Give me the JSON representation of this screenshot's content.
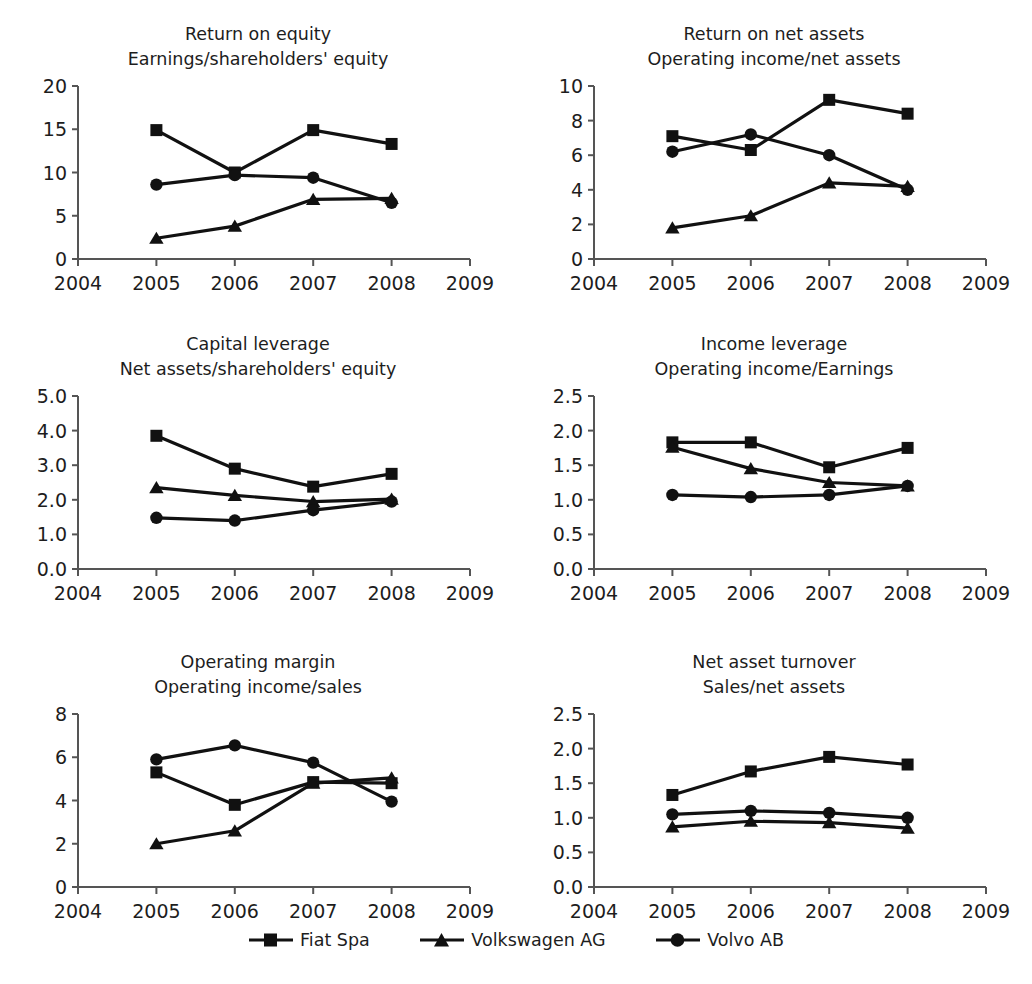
{
  "figure": {
    "series_names": [
      "Fiat Spa",
      "Volkswagen AG",
      "Volvo AB"
    ],
    "x_categories": [
      "2005",
      "2006",
      "2007",
      "2008"
    ],
    "x_axis_ticks": [
      "2004",
      "2005",
      "2006",
      "2007",
      "2008",
      "2009"
    ],
    "marker_color": "#111111",
    "line_color": "#111111",
    "axis_color": "#555555"
  },
  "legend": {
    "items": [
      {
        "label": "Fiat Spa",
        "marker": "square-marker"
      },
      {
        "label": "Volkswagen AG",
        "marker": "triangle-marker"
      },
      {
        "label": "Volvo AB",
        "marker": "circle-marker"
      }
    ]
  },
  "chart_data": [
    {
      "id": "return-on-equity",
      "type": "line",
      "title": "Return on equity",
      "subtitle": "Earnings/shareholders' equity",
      "xlabel": "",
      "ylabel": "",
      "x": [
        "2005",
        "2006",
        "2007",
        "2008"
      ],
      "xticks": [
        "2004",
        "2005",
        "2006",
        "2007",
        "2008",
        "2009"
      ],
      "yticks": [
        "0",
        "5",
        "10",
        "15",
        "20"
      ],
      "ylim": [
        0,
        20
      ],
      "grid": false,
      "legend_position": "bottom",
      "series": [
        {
          "name": "Fiat Spa",
          "marker": "square",
          "values": [
            14.9,
            10.0,
            14.9,
            13.3
          ]
        },
        {
          "name": "Volkswagen AG",
          "marker": "triangle",
          "values": [
            2.4,
            3.8,
            6.9,
            7.0
          ]
        },
        {
          "name": "Volvo AB",
          "marker": "circle",
          "values": [
            8.6,
            9.7,
            9.4,
            6.5
          ]
        }
      ]
    },
    {
      "id": "return-on-net-assets",
      "type": "line",
      "title": "Return on net assets",
      "subtitle": "Operating income/net assets",
      "xlabel": "",
      "ylabel": "",
      "x": [
        "2005",
        "2006",
        "2007",
        "2008"
      ],
      "xticks": [
        "2004",
        "2005",
        "2006",
        "2007",
        "2008",
        "2009"
      ],
      "yticks": [
        "0",
        "2",
        "4",
        "6",
        "8",
        "10"
      ],
      "ylim": [
        0,
        10
      ],
      "grid": false,
      "legend_position": "bottom",
      "series": [
        {
          "name": "Fiat Spa",
          "marker": "square",
          "values": [
            7.1,
            6.3,
            9.2,
            8.4
          ]
        },
        {
          "name": "Volkswagen AG",
          "marker": "triangle",
          "values": [
            1.8,
            2.5,
            4.4,
            4.2
          ]
        },
        {
          "name": "Volvo AB",
          "marker": "circle",
          "values": [
            6.2,
            7.2,
            6.0,
            4.0
          ]
        }
      ]
    },
    {
      "id": "capital-leverage",
      "type": "line",
      "title": "Capital leverage",
      "subtitle": "Net assets/shareholders' equity",
      "xlabel": "",
      "ylabel": "",
      "x": [
        "2005",
        "2006",
        "2007",
        "2008"
      ],
      "xticks": [
        "2004",
        "2005",
        "2006",
        "2007",
        "2008",
        "2009"
      ],
      "yticks": [
        "0.0",
        "1.0",
        "2.0",
        "3.0",
        "4.0",
        "5.0"
      ],
      "ylim": [
        0,
        5
      ],
      "grid": false,
      "legend_position": "bottom",
      "series": [
        {
          "name": "Fiat Spa",
          "marker": "square",
          "values": [
            3.85,
            2.9,
            2.38,
            2.75
          ]
        },
        {
          "name": "Volkswagen AG",
          "marker": "triangle",
          "values": [
            2.35,
            2.13,
            1.95,
            2.02
          ]
        },
        {
          "name": "Volvo AB",
          "marker": "circle",
          "values": [
            1.48,
            1.4,
            1.7,
            1.95
          ]
        }
      ]
    },
    {
      "id": "income-leverage",
      "type": "line",
      "title": "Income leverage",
      "subtitle": "Operating income/Earnings",
      "xlabel": "",
      "ylabel": "",
      "x": [
        "2005",
        "2006",
        "2007",
        "2008"
      ],
      "xticks": [
        "2004",
        "2005",
        "2006",
        "2007",
        "2008",
        "2009"
      ],
      "yticks": [
        "0.0",
        "0.5",
        "1.0",
        "1.5",
        "2.0",
        "2.5"
      ],
      "ylim": [
        0,
        2.5
      ],
      "grid": false,
      "legend_position": "bottom",
      "series": [
        {
          "name": "Fiat Spa",
          "marker": "square",
          "values": [
            1.83,
            1.83,
            1.47,
            1.75
          ]
        },
        {
          "name": "Volkswagen AG",
          "marker": "triangle",
          "values": [
            1.76,
            1.45,
            1.25,
            1.2
          ]
        },
        {
          "name": "Volvo AB",
          "marker": "circle",
          "values": [
            1.07,
            1.04,
            1.07,
            1.2
          ]
        }
      ]
    },
    {
      "id": "operating-margin",
      "type": "line",
      "title": "Operating margin",
      "subtitle": "Operating income/sales",
      "xlabel": "",
      "ylabel": "",
      "x": [
        "2005",
        "2006",
        "2007",
        "2008"
      ],
      "xticks": [
        "2004",
        "2005",
        "2006",
        "2007",
        "2008",
        "2009"
      ],
      "yticks": [
        "0",
        "2",
        "4",
        "6",
        "8"
      ],
      "ylim": [
        0,
        8
      ],
      "grid": false,
      "legend_position": "bottom",
      "series": [
        {
          "name": "Fiat Spa",
          "marker": "square",
          "values": [
            5.3,
            3.8,
            4.85,
            4.8
          ]
        },
        {
          "name": "Volkswagen AG",
          "marker": "triangle",
          "values": [
            2.0,
            2.6,
            4.8,
            5.05
          ]
        },
        {
          "name": "Volvo AB",
          "marker": "circle",
          "values": [
            5.9,
            6.55,
            5.75,
            3.95
          ]
        }
      ]
    },
    {
      "id": "net-asset-turnover",
      "type": "line",
      "title": "Net asset turnover",
      "subtitle": "Sales/net assets",
      "xlabel": "",
      "ylabel": "",
      "x": [
        "2005",
        "2006",
        "2007",
        "2008"
      ],
      "xticks": [
        "2004",
        "2005",
        "2006",
        "2007",
        "2008",
        "2009"
      ],
      "yticks": [
        "0.0",
        "0.5",
        "1.0",
        "1.5",
        "2.0",
        "2.5"
      ],
      "ylim": [
        0,
        2.5
      ],
      "grid": false,
      "legend_position": "bottom",
      "series": [
        {
          "name": "Fiat Spa",
          "marker": "square",
          "values": [
            1.33,
            1.67,
            1.88,
            1.77
          ]
        },
        {
          "name": "Volkswagen AG",
          "marker": "triangle",
          "values": [
            0.87,
            0.95,
            0.93,
            0.85
          ]
        },
        {
          "name": "Volvo AB",
          "marker": "circle",
          "values": [
            1.05,
            1.1,
            1.07,
            1.0
          ]
        }
      ]
    }
  ]
}
